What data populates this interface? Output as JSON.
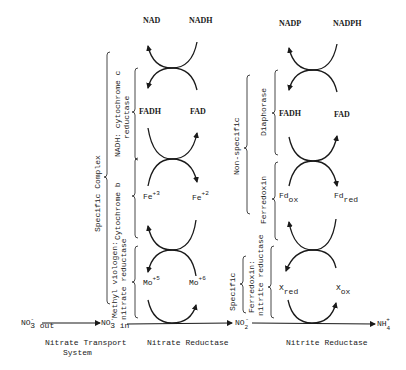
{
  "diagram": {
    "nitrate_reductase_column": {
      "cofactors": {
        "nad": "NAD",
        "nadh": "NADH",
        "fadh": "FADH",
        "fad": "FAD",
        "fe3": "Fe",
        "fe3_sup": "+3",
        "fe2": "Fe",
        "fe2_sup": "+2",
        "mo5": "Mo",
        "mo5_sup": "+5",
        "mo6": "Mo",
        "mo6_sup": "+6"
      },
      "brace_labels": {
        "outer": "Specific Complex",
        "nadh_cyt_c_line1": "NADH: cytochrome c",
        "nadh_cyt_c_line2": "reductase",
        "cytochrome_b": "Cytochrome b",
        "methyl_viologen_line1": "Methyl viologen:",
        "methyl_viologen_line2": "nitrate reductase"
      }
    },
    "nitrite_reductase_column": {
      "cofactors": {
        "nadp": "NADP",
        "nadph": "NADPH",
        "fadh": "FADH",
        "fad": "FAD",
        "fd_ox": "Fd",
        "fd_ox_sub": "ox",
        "fd_red": "Fd",
        "fd_red_sub": "red",
        "x_red": "X",
        "x_red_sub": "red",
        "x_ox": "X",
        "x_ox_sub": "ox"
      },
      "brace_labels": {
        "non_specific": "Non-specific",
        "diaphorase": "Diaphorase",
        "ferredoxin": "Ferredoxin",
        "specific": "Specific",
        "fd_nitrite_line1": "Ferredoxin:",
        "fd_nitrite_line2": "nitrite reductase"
      }
    },
    "pathway": {
      "no3_out": "NO",
      "no3_out_sub": "3 out",
      "no3_out_sup": "-",
      "no3_in": "NO",
      "no3_in_sub": "3 in",
      "no3_in_sup": "-",
      "no2": "NO",
      "no2_sub": "2",
      "no2_sup": "-",
      "nh4": "NH",
      "nh4_sub": "4",
      "nh4_sup": "+"
    },
    "stage_labels": {
      "transport_line1": "Nitrate Transport",
      "transport_line2": "System",
      "nitrate_reductase": "Nitrate Reductase",
      "nitrite_reductase": "Nitrite Reductase"
    }
  }
}
